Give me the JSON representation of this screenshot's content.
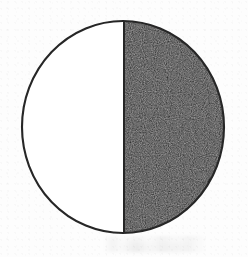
{
  "figure": {
    "name": "half-filled-circle",
    "caption": "",
    "background_color": "#fdfdfd",
    "outline_color": "#262626",
    "fill_color": "#1e1c1c",
    "empty_color": "#ffffff",
    "outline_width_px": 2,
    "center_x": 123,
    "center_y": 127,
    "radius_x": 101,
    "radius_y": 106,
    "divider_x": 124,
    "divider_orientation": "vertical",
    "filled_side": "right"
  },
  "chart_data": {
    "type": "pie",
    "title": "",
    "subtitle": "",
    "xlabel": "",
    "ylabel": "",
    "categories": [
      "Filled",
      "Unfilled"
    ],
    "values": [
      50,
      50
    ],
    "value_unit": "percent",
    "colors": [
      "#1e1c1c",
      "#ffffff"
    ],
    "labels_shown": false,
    "legend": [],
    "legend_position": "none",
    "annotations": [],
    "start_angle_deg": 0,
    "direction": "clockwise",
    "grid": false
  },
  "artifacts": {
    "smudge_label": "faint scan smudge below circle",
    "grain_label": "halftone print grain in filled region"
  }
}
